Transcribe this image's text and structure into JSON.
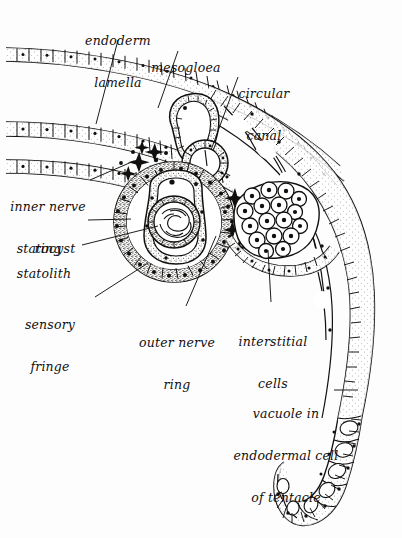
{
  "figure": {
    "technique": "ink line drawing, stippled histological section",
    "background_color": "#fdfdfd",
    "ink_color": "#12100f",
    "width": 402,
    "height": 538
  },
  "labels": [
    {
      "id": "endoderm-lamella",
      "lines": [
        "endoderm",
        "lamella"
      ],
      "x": 118,
      "y": 10,
      "align": "center",
      "leader": {
        "from_x": 118,
        "from_y": 40,
        "to_x": 96,
        "to_y": 124
      }
    },
    {
      "id": "mesogloea",
      "lines": [
        "mesogloea"
      ],
      "x": 186,
      "y": 36,
      "align": "center",
      "leader": {
        "from_x": 178,
        "from_y": 51,
        "to_x": 158,
        "to_y": 108
      }
    },
    {
      "id": "circular-canal",
      "lines": [
        "circular",
        "canal"
      ],
      "x": 264,
      "y": 62,
      "align": "center",
      "leader": {
        "from_x": 238,
        "from_y": 77,
        "to_x": 211,
        "to_y": 150
      }
    },
    {
      "id": "inner-nerve-ring",
      "lines": [
        "inner nerve",
        "ring"
      ],
      "x": 48,
      "y": 174,
      "align": "center",
      "leader": {
        "from_x": 90,
        "from_y": 180,
        "to_x": 128,
        "to_y": 163
      }
    },
    {
      "id": "statocyst",
      "lines": [
        "statocyst"
      ],
      "x": 46,
      "y": 216,
      "align": "center",
      "leader": {
        "from_x": 88,
        "from_y": 220,
        "to_x": 130,
        "to_y": 218
      }
    },
    {
      "id": "statolith",
      "lines": [
        "statolith"
      ],
      "x": 44,
      "y": 241,
      "align": "center",
      "leader": {
        "from_x": 82,
        "from_y": 245,
        "to_x": 158,
        "to_y": 226
      }
    },
    {
      "id": "sensory-fringe",
      "lines": [
        "sensory",
        "fringe"
      ],
      "x": 48,
      "y": 294,
      "align": "center",
      "leader": {
        "from_x": 95,
        "from_y": 297,
        "to_x": 148,
        "to_y": 263
      }
    },
    {
      "id": "outer-nerve-ring",
      "lines": [
        "outer nerve",
        "ring"
      ],
      "x": 177,
      "y": 312,
      "align": "center",
      "leader": {
        "from_x": 186,
        "from_y": 310,
        "to_x": 214,
        "to_y": 238
      }
    },
    {
      "id": "interstitial-cells",
      "lines": [
        "interstitial",
        "cells"
      ],
      "x": 273,
      "y": 311,
      "align": "center",
      "leader": {
        "from_x": 271,
        "from_y": 306,
        "to_x": 268,
        "to_y": 248
      }
    },
    {
      "id": "vacuole-in-endodermal-cell-of-tentacle",
      "lines": [
        "vacuole in",
        "endodermal cell",
        "of tentacle"
      ],
      "x": 286,
      "y": 383,
      "align": "center",
      "leader": {
        "from_x": 334,
        "from_y": 390,
        "to_x": 356,
        "to_y": 390
      }
    }
  ],
  "structures": [
    {
      "id": "exumbrella-epithelium",
      "name": "outer epithelial band"
    },
    {
      "id": "endoderm-lamella-band",
      "name": "endoderm lamella band"
    },
    {
      "id": "subumbrella-epithelium",
      "name": "inner epithelial band"
    },
    {
      "id": "circular-canal-lumen",
      "name": "circular canal lumen"
    },
    {
      "id": "statocyst-capsule",
      "name": "statocyst capsule"
    },
    {
      "id": "statolith-mass",
      "name": "statolith mass"
    },
    {
      "id": "sensory-fringe-ring",
      "name": "sensory fringe ring"
    },
    {
      "id": "interstitial-cell-cluster",
      "name": "interstitial cell cluster"
    },
    {
      "id": "tentacle-column",
      "name": "tentacle endodermal cell column"
    }
  ]
}
